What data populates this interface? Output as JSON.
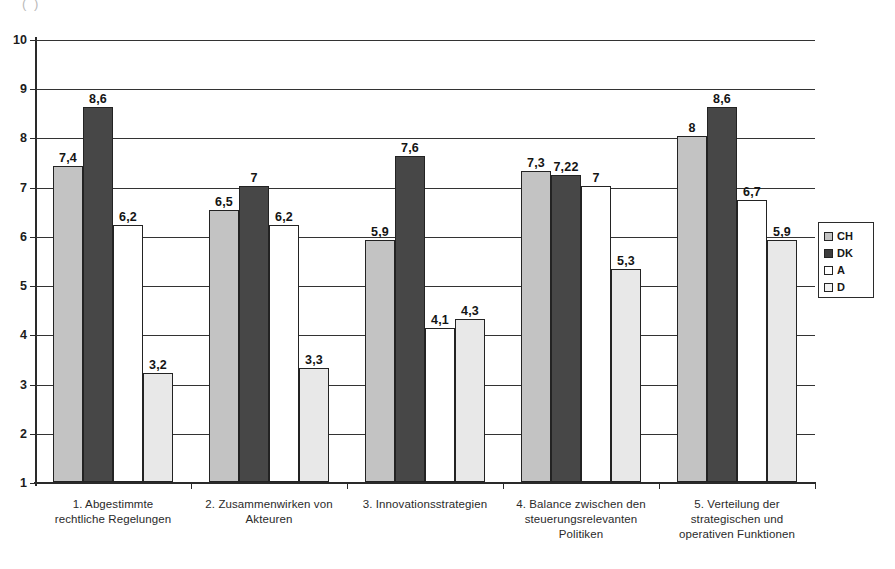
{
  "document": {
    "clipped_top_text": "(          )"
  },
  "legend": {
    "position": "right",
    "entries": [
      {
        "key": "CH",
        "label": "CH",
        "swatch": "light-gray"
      },
      {
        "key": "DK",
        "label": "DK",
        "swatch": "dark-gray"
      },
      {
        "key": "A",
        "label": "A",
        "swatch": "white"
      },
      {
        "key": "D",
        "label": "D",
        "swatch": "very-light-gray"
      }
    ]
  },
  "axis": {
    "y_ticks": [
      "10",
      "9",
      "8",
      "7",
      "6",
      "5",
      "4",
      "3",
      "2",
      "1"
    ]
  },
  "chart_data": {
    "type": "bar",
    "title": "",
    "xlabel": "",
    "ylabel": "",
    "ylim": [
      1,
      10
    ],
    "grid": true,
    "legend_position": "right",
    "categories": [
      "1. Abgestimmte rechtliche Regelungen",
      "2. Zusammenwirken von Akteuren",
      "3. Innovationsstrategien",
      "4. Balance zwischen den steuerungsrelevanten Politiken",
      "5. Verteilung der strategischen und operativen Funktionen"
    ],
    "category_lines": [
      [
        "1. Abgestimmte",
        "rechtliche Regelungen"
      ],
      [
        "2. Zusammenwirken von",
        "Akteuren"
      ],
      [
        "3. Innovationsstrategien"
      ],
      [
        "4. Balance zwischen den",
        "steuerungsrelevanten",
        "Politiken"
      ],
      [
        "5. Verteilung der",
        "strategischen und",
        "operativen Funktionen"
      ]
    ],
    "series": [
      {
        "name": "CH",
        "color": "#c3c3c3",
        "values": [
          7.4,
          6.5,
          5.9,
          7.3,
          8
        ],
        "labels": [
          "7,4",
          "6,5",
          "5,9",
          "7,3",
          "8"
        ]
      },
      {
        "name": "DK",
        "color": "#474747",
        "values": [
          8.6,
          7,
          7.6,
          7.22,
          8.6
        ],
        "labels": [
          "8,6",
          "7",
          "7,6",
          "7,22",
          "8,6"
        ]
      },
      {
        "name": "A",
        "color": "#ffffff",
        "values": [
          6.2,
          6.2,
          4.1,
          7,
          6.7
        ],
        "labels": [
          "6,2",
          "6,2",
          "4,1",
          "7",
          "6,7"
        ]
      },
      {
        "name": "D",
        "color": "#e8e8e8",
        "values": [
          3.2,
          3.3,
          4.3,
          5.3,
          5.9
        ],
        "labels": [
          "3,2",
          "3,3",
          "4,3",
          "5,3",
          "5,9"
        ]
      }
    ]
  }
}
